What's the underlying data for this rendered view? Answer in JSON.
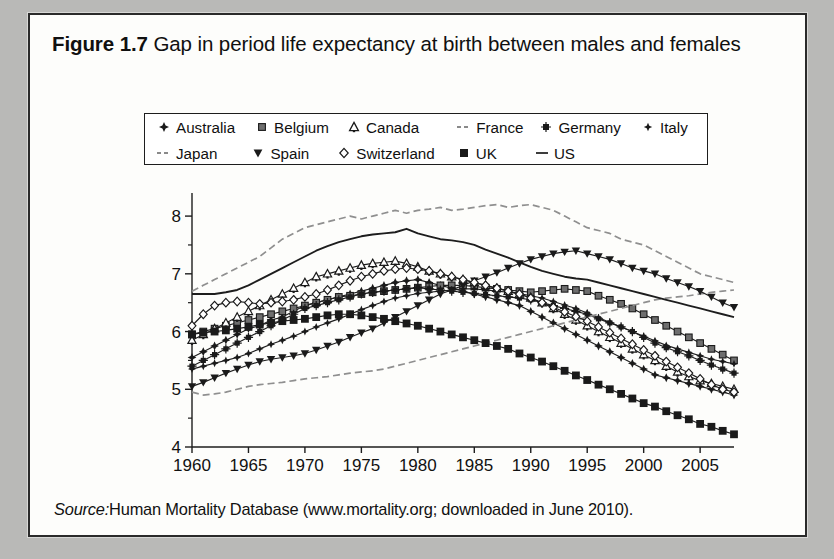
{
  "figure": {
    "number_label": "Figure 1.7",
    "title": "Gap in period life expectancy at birth between males and females",
    "source_label": "Source:",
    "source_text": "Human Mortality Database (www.mortality.org; downloaded in June 2010)."
  },
  "colors": {
    "line": "#1d1d1d",
    "marker_fill_dark": "#1a1a1a",
    "marker_fill_mid": "#6e6e6e",
    "marker_fill_light": "#ffffff",
    "axis": "#1d1d1d",
    "page_background": "#b9b9b7",
    "card_background": "#fdfdfb"
  },
  "legend": {
    "rows": [
      [
        {
          "label": "Australia",
          "marker": "four-point-star-icon"
        },
        {
          "label": "Belgium",
          "marker": "filled-square-icon"
        },
        {
          "label": "Canada",
          "marker": "club-triangle-icon"
        },
        {
          "label": "France",
          "marker": "dashed-line-icon"
        },
        {
          "label": "Germany",
          "marker": "asterisk-square-icon"
        },
        {
          "label": "Italy",
          "marker": "small-star-icon"
        }
      ],
      [
        {
          "label": "Japan",
          "marker": "dashed-line-icon"
        },
        {
          "label": "Spain",
          "marker": "down-triangle-icon"
        },
        {
          "label": "Switzerland",
          "marker": "open-diamond-icon"
        },
        {
          "label": "UK",
          "marker": "bold-filled-square-icon"
        },
        {
          "label": "US",
          "marker": "solid-line-icon"
        }
      ]
    ]
  },
  "chart_data": {
    "type": "line",
    "title": "Gap in period life expectancy at birth between males and females",
    "xlabel": "",
    "ylabel": "",
    "xlim": [
      1960,
      2008
    ],
    "ylim": [
      4,
      8.4
    ],
    "x_ticks": [
      1960,
      1965,
      1970,
      1975,
      1980,
      1985,
      1990,
      1995,
      2000,
      2005
    ],
    "y_ticks": [
      4,
      5,
      6,
      7,
      8
    ],
    "y_minor_ticks": [
      4.5,
      5.5,
      6.5,
      7.5
    ],
    "grid": false,
    "legend_position": "top",
    "units": "years",
    "x": [
      1960,
      1961,
      1962,
      1963,
      1964,
      1965,
      1966,
      1967,
      1968,
      1969,
      1970,
      1971,
      1972,
      1973,
      1974,
      1975,
      1976,
      1977,
      1978,
      1979,
      1980,
      1981,
      1982,
      1983,
      1984,
      1985,
      1986,
      1987,
      1988,
      1989,
      1990,
      1991,
      1992,
      1993,
      1994,
      1995,
      1996,
      1997,
      1998,
      1999,
      2000,
      2001,
      2002,
      2003,
      2004,
      2005,
      2006,
      2007,
      2008
    ],
    "series": [
      {
        "name": "Australia",
        "marker": "four-point-star-icon",
        "style": "solid",
        "values": [
          5.55,
          5.65,
          5.75,
          5.85,
          5.95,
          6.05,
          6.1,
          6.2,
          6.25,
          6.35,
          6.45,
          6.5,
          6.55,
          6.6,
          6.65,
          6.7,
          6.75,
          6.8,
          6.85,
          6.88,
          6.9,
          6.85,
          6.8,
          6.75,
          6.7,
          6.65,
          6.6,
          6.55,
          6.5,
          6.45,
          6.35,
          6.25,
          6.15,
          6.05,
          5.95,
          5.85,
          5.75,
          5.65,
          5.55,
          5.45,
          5.35,
          5.25,
          5.2,
          5.15,
          5.1,
          5.05,
          5.0,
          4.95,
          4.9
        ]
      },
      {
        "name": "Belgium",
        "marker": "filled-square-icon",
        "style": "solid",
        "values": [
          5.95,
          6.0,
          6.05,
          6.1,
          6.15,
          6.2,
          6.25,
          6.3,
          6.35,
          6.4,
          6.45,
          6.5,
          6.55,
          6.6,
          6.62,
          6.65,
          6.68,
          6.7,
          6.72,
          6.74,
          6.76,
          6.78,
          6.8,
          6.8,
          6.8,
          6.78,
          6.76,
          6.74,
          6.72,
          6.7,
          6.68,
          6.7,
          6.72,
          6.74,
          6.72,
          6.7,
          6.62,
          6.55,
          6.48,
          6.4,
          6.3,
          6.2,
          6.1,
          6.0,
          5.9,
          5.8,
          5.7,
          5.6,
          5.5
        ]
      },
      {
        "name": "Canada",
        "marker": "club-triangle-icon",
        "style": "solid",
        "values": [
          5.85,
          5.95,
          6.05,
          6.15,
          6.25,
          6.35,
          6.45,
          6.55,
          6.65,
          6.75,
          6.85,
          6.95,
          7.0,
          7.05,
          7.1,
          7.15,
          7.18,
          7.2,
          7.22,
          7.18,
          7.12,
          7.05,
          7.0,
          6.95,
          6.9,
          6.85,
          6.8,
          6.75,
          6.7,
          6.65,
          6.58,
          6.5,
          6.4,
          6.3,
          6.2,
          6.1,
          6.0,
          5.9,
          5.8,
          5.7,
          5.6,
          5.5,
          5.4,
          5.3,
          5.22,
          5.15,
          5.1,
          5.05,
          5.0
        ]
      },
      {
        "name": "France",
        "marker": "dashed-line-icon",
        "style": "dashed",
        "values": [
          6.7,
          6.8,
          6.9,
          7.0,
          7.1,
          7.2,
          7.3,
          7.45,
          7.6,
          7.7,
          7.8,
          7.85,
          7.9,
          7.95,
          8.0,
          7.95,
          8.0,
          8.05,
          8.1,
          8.05,
          8.1,
          8.12,
          8.15,
          8.1,
          8.12,
          8.15,
          8.18,
          8.2,
          8.15,
          8.18,
          8.2,
          8.15,
          8.1,
          8.0,
          7.9,
          7.8,
          7.75,
          7.7,
          7.6,
          7.55,
          7.5,
          7.4,
          7.3,
          7.2,
          7.1,
          7.0,
          6.95,
          6.9,
          6.85
        ]
      },
      {
        "name": "Germany",
        "marker": "asterisk-square-icon",
        "style": "solid",
        "values": [
          5.4,
          5.5,
          5.6,
          5.7,
          5.8,
          5.9,
          6.0,
          6.1,
          6.2,
          6.3,
          6.4,
          6.45,
          6.5,
          6.55,
          6.6,
          6.65,
          6.68,
          6.7,
          6.72,
          6.74,
          6.76,
          6.74,
          6.72,
          6.7,
          6.68,
          6.66,
          6.64,
          6.62,
          6.6,
          6.58,
          6.55,
          6.5,
          6.45,
          6.4,
          6.35,
          6.3,
          6.22,
          6.15,
          6.08,
          6.0,
          5.9,
          5.8,
          5.72,
          5.65,
          5.58,
          5.5,
          5.42,
          5.35,
          5.28
        ]
      },
      {
        "name": "Italy",
        "marker": "small-star-icon",
        "style": "solid",
        "values": [
          5.35,
          5.4,
          5.45,
          5.5,
          5.55,
          5.62,
          5.7,
          5.78,
          5.85,
          5.92,
          6.0,
          6.08,
          6.15,
          6.22,
          6.3,
          6.38,
          6.45,
          6.52,
          6.58,
          6.62,
          6.66,
          6.68,
          6.7,
          6.72,
          6.74,
          6.74,
          6.72,
          6.7,
          6.68,
          6.66,
          6.62,
          6.58,
          6.52,
          6.46,
          6.4,
          6.32,
          6.24,
          6.16,
          6.08,
          6.0,
          5.92,
          5.84,
          5.76,
          5.7,
          5.64,
          5.58,
          5.52,
          5.48,
          5.44
        ]
      },
      {
        "name": "Japan",
        "marker": "dashed-line-icon",
        "style": "dashed",
        "values": [
          4.95,
          4.9,
          4.92,
          4.95,
          5.0,
          5.05,
          5.08,
          5.1,
          5.12,
          5.15,
          5.18,
          5.2,
          5.22,
          5.25,
          5.28,
          5.3,
          5.32,
          5.35,
          5.4,
          5.45,
          5.5,
          5.55,
          5.6,
          5.65,
          5.7,
          5.75,
          5.8,
          5.85,
          5.9,
          5.95,
          6.0,
          6.05,
          6.1,
          6.15,
          6.2,
          6.25,
          6.3,
          6.35,
          6.4,
          6.45,
          6.5,
          6.55,
          6.58,
          6.6,
          6.62,
          6.65,
          6.68,
          6.7,
          6.72
        ]
      },
      {
        "name": "Spain",
        "marker": "down-triangle-icon",
        "style": "solid",
        "values": [
          5.05,
          5.12,
          5.2,
          5.28,
          5.35,
          5.42,
          5.48,
          5.52,
          5.55,
          5.58,
          5.62,
          5.68,
          5.75,
          5.82,
          5.9,
          5.98,
          6.05,
          6.15,
          6.25,
          6.35,
          6.45,
          6.55,
          6.65,
          6.72,
          6.8,
          6.88,
          6.95,
          7.02,
          7.1,
          7.18,
          7.25,
          7.3,
          7.35,
          7.38,
          7.4,
          7.35,
          7.3,
          7.25,
          7.18,
          7.1,
          7.05,
          7.0,
          6.92,
          6.85,
          6.78,
          6.7,
          6.6,
          6.5,
          6.42
        ]
      },
      {
        "name": "Switzerland",
        "marker": "open-diamond-icon",
        "style": "solid",
        "values": [
          6.1,
          6.3,
          6.45,
          6.5,
          6.52,
          6.5,
          6.48,
          6.5,
          6.52,
          6.55,
          6.6,
          6.65,
          6.72,
          6.8,
          6.88,
          6.95,
          7.0,
          7.05,
          7.08,
          7.1,
          7.08,
          7.05,
          7.0,
          6.95,
          6.9,
          6.85,
          6.8,
          6.75,
          6.7,
          6.65,
          6.58,
          6.5,
          6.42,
          6.34,
          6.26,
          6.18,
          6.08,
          5.98,
          5.88,
          5.78,
          5.68,
          5.58,
          5.48,
          5.38,
          5.28,
          5.18,
          5.08,
          5.0,
          4.95
        ]
      },
      {
        "name": "UK",
        "marker": "bold-filled-square-icon",
        "style": "solid",
        "values": [
          5.95,
          5.98,
          6.0,
          6.02,
          6.05,
          6.08,
          6.12,
          6.15,
          6.18,
          6.2,
          6.22,
          6.25,
          6.28,
          6.3,
          6.3,
          6.28,
          6.25,
          6.22,
          6.18,
          6.14,
          6.1,
          6.05,
          6.0,
          5.95,
          5.9,
          5.85,
          5.8,
          5.75,
          5.7,
          5.62,
          5.55,
          5.48,
          5.4,
          5.32,
          5.24,
          5.16,
          5.08,
          5.0,
          4.92,
          4.84,
          4.76,
          4.7,
          4.62,
          4.55,
          4.48,
          4.4,
          4.35,
          4.28,
          4.22
        ]
      },
      {
        "name": "US",
        "marker": "solid-line-icon",
        "style": "solid-noline",
        "values": [
          6.65,
          6.65,
          6.65,
          6.68,
          6.72,
          6.8,
          6.9,
          7.0,
          7.1,
          7.2,
          7.3,
          7.4,
          7.48,
          7.55,
          7.6,
          7.65,
          7.68,
          7.7,
          7.72,
          7.78,
          7.7,
          7.65,
          7.6,
          7.58,
          7.55,
          7.5,
          7.42,
          7.35,
          7.28,
          7.2,
          7.12,
          7.05,
          7.0,
          6.95,
          6.92,
          6.9,
          6.85,
          6.8,
          6.75,
          6.7,
          6.65,
          6.6,
          6.55,
          6.5,
          6.45,
          6.4,
          6.35,
          6.3,
          6.25
        ]
      }
    ]
  }
}
